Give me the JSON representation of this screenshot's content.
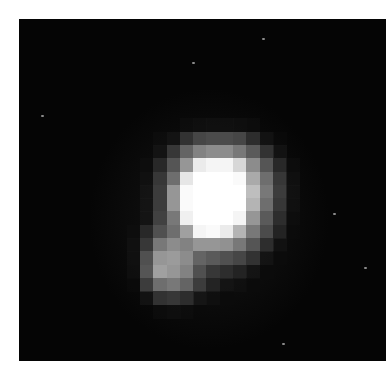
{
  "image": {
    "subject": "pixelated grayscale point source with secondary lobe at lower-left",
    "background_color": "#050505",
    "frame": {
      "left": 19,
      "top": 19,
      "width": 367,
      "height": 342
    },
    "grid": {
      "origin_x": 81,
      "origin_y": 86,
      "cell": 13.3,
      "rows": [
        [
          0,
          0,
          0,
          0,
          0,
          0,
          0,
          0,
          0,
          0,
          0,
          0,
          0,
          0,
          0
        ],
        [
          0,
          0,
          0,
          0,
          0,
          0,
          15,
          18,
          20,
          20,
          18,
          15,
          0,
          0,
          0
        ],
        [
          0,
          0,
          0,
          0,
          15,
          25,
          50,
          70,
          75,
          75,
          70,
          45,
          25,
          12,
          0
        ],
        [
          0,
          0,
          0,
          0,
          25,
          55,
          100,
          130,
          140,
          140,
          120,
          90,
          50,
          25,
          0
        ],
        [
          0,
          0,
          0,
          15,
          40,
          85,
          150,
          235,
          245,
          245,
          215,
          140,
          85,
          40,
          15
        ],
        [
          0,
          0,
          0,
          20,
          55,
          110,
          230,
          255,
          255,
          255,
          250,
          170,
          110,
          55,
          20
        ],
        [
          0,
          0,
          0,
          25,
          60,
          150,
          250,
          255,
          255,
          255,
          255,
          190,
          120,
          60,
          22
        ],
        [
          0,
          0,
          0,
          25,
          60,
          150,
          250,
          255,
          255,
          255,
          255,
          180,
          110,
          55,
          20
        ],
        [
          0,
          0,
          0,
          25,
          65,
          120,
          240,
          255,
          255,
          255,
          245,
          150,
          90,
          45,
          15
        ],
        [
          0,
          0,
          15,
          40,
          80,
          110,
          160,
          245,
          250,
          235,
          180,
          120,
          75,
          35,
          12
        ],
        [
          0,
          0,
          20,
          55,
          120,
          140,
          130,
          150,
          150,
          145,
          120,
          85,
          45,
          22,
          0
        ],
        [
          0,
          0,
          20,
          80,
          150,
          155,
          140,
          100,
          90,
          80,
          70,
          50,
          25,
          12,
          0
        ],
        [
          0,
          0,
          18,
          85,
          160,
          150,
          130,
          80,
          55,
          45,
          35,
          25,
          12,
          0,
          0
        ],
        [
          0,
          0,
          12,
          60,
          110,
          120,
          100,
          60,
          35,
          25,
          18,
          12,
          0,
          0,
          0
        ],
        [
          0,
          0,
          0,
          25,
          50,
          55,
          45,
          28,
          18,
          12,
          0,
          0,
          0,
          0,
          0
        ],
        [
          0,
          0,
          0,
          0,
          15,
          18,
          15,
          10,
          0,
          0,
          0,
          0,
          0,
          0,
          0
        ]
      ]
    },
    "specks": [
      {
        "x": 192,
        "y": 62
      },
      {
        "x": 262,
        "y": 38
      },
      {
        "x": 41,
        "y": 115
      },
      {
        "x": 364,
        "y": 267
      },
      {
        "x": 333,
        "y": 213
      },
      {
        "x": 282,
        "y": 343
      }
    ]
  }
}
